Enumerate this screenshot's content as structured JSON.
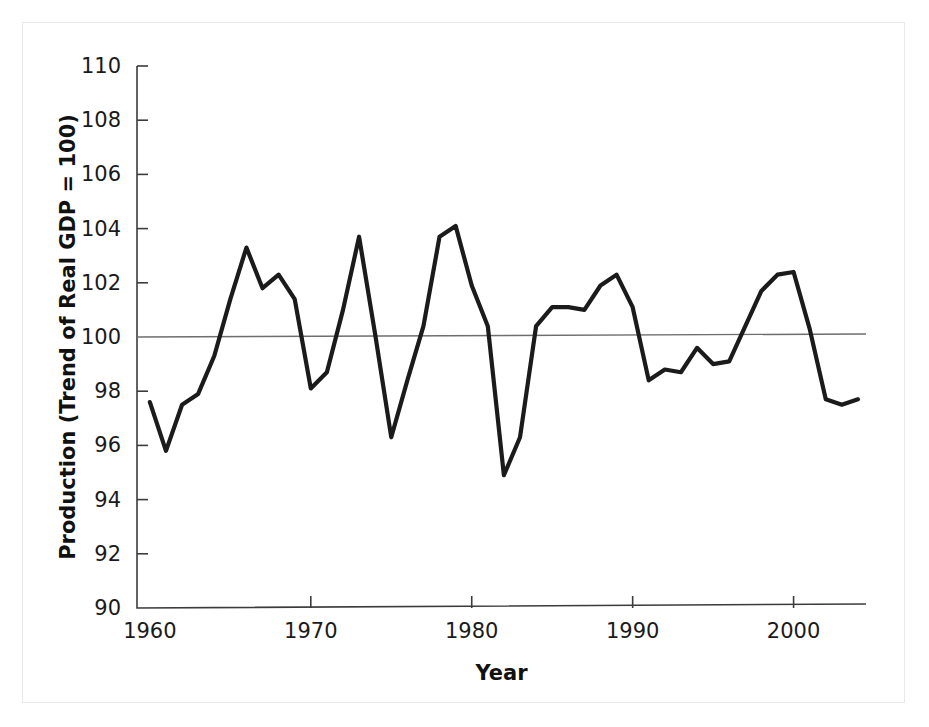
{
  "figure": {
    "background_color": "#ffffff",
    "border_color": "#e9e9e9",
    "line_color": "#1b1b1b",
    "axis_color": "#3c3c3c",
    "reference_line_color": "#6e6e6e"
  },
  "chart_data": {
    "type": "line",
    "title": "",
    "subtitle": "",
    "xlabel": "Year",
    "ylabel": "Production (Trend of Real GDP = 100)",
    "xlim": [
      1959.2,
      2004.5
    ],
    "ylim": [
      90,
      110
    ],
    "grid": false,
    "legend": null,
    "annotations": [
      {
        "kind": "reference-line",
        "axis": "y",
        "value": 100,
        "label": "100"
      }
    ],
    "xticks": [
      1960,
      1970,
      1980,
      1990,
      2000
    ],
    "xtick_labels": [
      "1960",
      "1970",
      "1980",
      "1990",
      "2000"
    ],
    "yticks": [
      90,
      92,
      94,
      96,
      98,
      100,
      102,
      104,
      106,
      108,
      110
    ],
    "ytick_labels": [
      "90",
      "92",
      "94",
      "96",
      "98",
      "100",
      "102",
      "104",
      "106",
      "108",
      "110"
    ],
    "x": [
      1960,
      1961,
      1962,
      1963,
      1964,
      1965,
      1966,
      1967,
      1968,
      1969,
      1970,
      1971,
      1972,
      1973,
      1974,
      1975,
      1976,
      1977,
      1978,
      1979,
      1980,
      1981,
      1982,
      1983,
      1984,
      1985,
      1986,
      1987,
      1988,
      1989,
      1990,
      1991,
      1992,
      1993,
      1994,
      1995,
      1996,
      1997,
      1998,
      1999,
      2000,
      2001,
      2002,
      2003,
      2004
    ],
    "values": [
      97.6,
      95.8,
      97.5,
      97.9,
      99.3,
      101.4,
      103.3,
      101.8,
      102.3,
      101.4,
      98.1,
      98.7,
      101.0,
      103.7,
      100.1,
      96.3,
      98.4,
      100.4,
      103.7,
      104.1,
      101.9,
      100.4,
      94.9,
      96.3,
      100.4,
      101.1,
      101.1,
      101.0,
      101.9,
      102.3,
      101.1,
      98.4,
      98.8,
      98.7,
      99.6,
      99.0,
      99.1,
      100.4,
      101.7,
      102.3,
      102.4,
      100.3,
      97.7,
      97.5,
      97.7
    ],
    "series": [
      {
        "name": "Production (Trend of Real GDP = 100)",
        "values": [
          97.6,
          95.8,
          97.5,
          97.9,
          99.3,
          101.4,
          103.3,
          101.8,
          102.3,
          101.4,
          98.1,
          98.7,
          101.0,
          103.7,
          100.1,
          96.3,
          98.4,
          100.4,
          103.7,
          104.1,
          101.9,
          100.4,
          94.9,
          96.3,
          100.4,
          101.1,
          101.1,
          101.0,
          101.9,
          102.3,
          101.1,
          98.4,
          98.8,
          98.7,
          99.6,
          99.0,
          99.1,
          100.4,
          101.7,
          102.3,
          102.4,
          100.3,
          97.7,
          97.5,
          97.7
        ]
      }
    ]
  }
}
